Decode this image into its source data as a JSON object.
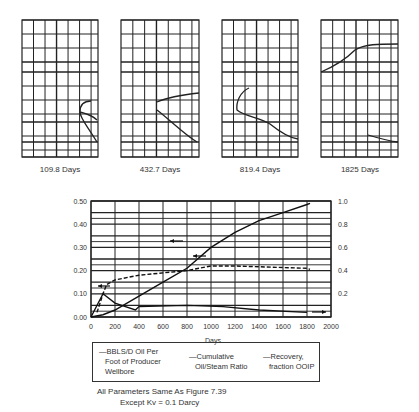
{
  "mini_charts": [
    {
      "label": "109.8 Days"
    },
    {
      "label": "432.7 Days"
    },
    {
      "label": "819.4 Days"
    },
    {
      "label": "1825 Days"
    }
  ],
  "chart_data": {
    "type": "line",
    "title": "",
    "xlabel": "Days",
    "ylabel_left": "",
    "ylabel_right": "",
    "xlim": [
      0,
      2000
    ],
    "ylim_left": [
      0.0,
      0.5
    ],
    "ylim_right": [
      0.0,
      1.0
    ],
    "x_ticks": [
      "0",
      "200",
      "400",
      "600",
      "800",
      "1000",
      "1200",
      "1400",
      "1600",
      "1800",
      "2000"
    ],
    "y_ticks_left": [
      "0.00",
      "0.10",
      "0.20",
      "0.30",
      "0.40",
      "0.50"
    ],
    "y_ticks_right": [
      "0.2",
      "0.4",
      "0.6",
      "0.8",
      "1.0"
    ],
    "grid": true,
    "legend_position": "below",
    "series": [
      {
        "name": "BBLS/D Oil Per Foot of Producer Wellbore",
        "axis": "left",
        "style": "solid",
        "x": [
          0,
          100,
          200,
          370,
          400,
          800,
          1100,
          1400,
          1800
        ],
        "y": [
          0.0,
          0.1,
          0.06,
          0.03,
          0.045,
          0.05,
          0.045,
          0.03,
          0.02
        ]
      },
      {
        "name": "Cumulative Oil/Steam Ratio",
        "axis": "left",
        "style": "dashed",
        "x": [
          50,
          100,
          130,
          200,
          400,
          600,
          800,
          1000,
          1200,
          1800,
          1825
        ],
        "y": [
          0.02,
          0.1,
          0.14,
          0.16,
          0.18,
          0.19,
          0.2,
          0.22,
          0.22,
          0.21,
          0.205
        ]
      },
      {
        "name": "Recovery, fraction OOIP",
        "axis": "right",
        "style": "solid",
        "x": [
          0,
          100,
          200,
          400,
          600,
          800,
          1000,
          1200,
          1400,
          1600,
          1800,
          1825
        ],
        "y": [
          0.0,
          0.02,
          0.06,
          0.18,
          0.3,
          0.42,
          0.6,
          0.73,
          0.83,
          0.9,
          0.97,
          0.98
        ]
      }
    ]
  },
  "legend": {
    "item1": {
      "line1": "—BBLS/D Oil Per",
      "line2": "Foot of Producer",
      "line3": "Wellbore"
    },
    "item2": {
      "line1": "—Cumulative",
      "line2": "Oil/Steam Ratio"
    },
    "item3": {
      "line1": "—Recovery,",
      "line2": "fraction OOIP"
    }
  },
  "caption": {
    "line1": "All Parameters Same As Figure 7.39",
    "line2": "Except Kv = 0.1 Darcy"
  }
}
